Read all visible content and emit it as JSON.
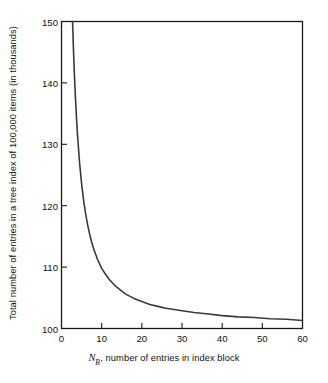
{
  "chart_data": {
    "type": "line",
    "title": "",
    "xlabel": "N_B, number of entries in index block",
    "xlabel_var": "N",
    "xlabel_sub": "B",
    "xlabel_rest": ", number of entries in index block",
    "ylabel": "Total number of entries in a tree index of 100,000 items (in thousands)",
    "xlim": [
      0,
      60
    ],
    "ylim": [
      100,
      150
    ],
    "xticks": [
      0,
      10,
      20,
      30,
      40,
      50,
      60
    ],
    "yticks": [
      100,
      110,
      120,
      130,
      140,
      150
    ],
    "xtick_labels": [
      "0",
      "10",
      "20",
      "30",
      "40",
      "50",
      "60"
    ],
    "ytick_labels": [
      "100",
      "110",
      "120",
      "130",
      "140",
      "150"
    ],
    "grid": false,
    "legend": "none",
    "line_color": "#3a3a3a",
    "axis_color": "#1a1a1a",
    "background": "#ffffff",
    "series": [
      {
        "name": "Total entries in tree index",
        "x": [
          2.75,
          3.0,
          3.25,
          3.5,
          3.75,
          4.0,
          4.5,
          5.0,
          5.5,
          6.0,
          6.5,
          7.0,
          7.5,
          8.0,
          9.0,
          10.0,
          11.0,
          12.0,
          13.0,
          14.0,
          15.0,
          16.0,
          18.0,
          20.0,
          22.0,
          24.0,
          26.0,
          28.0,
          30.0,
          33.0,
          36.0,
          40.0,
          44.0,
          48.0,
          52.0,
          56.0,
          60.0
        ],
        "y": [
          150.0,
          145.0,
          140.8,
          137.2,
          134.1,
          131.4,
          127.0,
          123.6,
          120.9,
          118.7,
          116.9,
          115.4,
          114.1,
          113.0,
          111.2,
          109.8,
          108.8,
          107.9,
          107.2,
          106.6,
          106.1,
          105.6,
          104.9,
          104.4,
          103.9,
          103.6,
          103.3,
          103.1,
          102.9,
          102.6,
          102.4,
          102.1,
          101.9,
          101.8,
          101.6,
          101.5,
          101.3
        ]
      }
    ]
  },
  "axes": {
    "ylabel_text": "Total number of entries in a tree index of 100,000 items (in thousands)",
    "xlabel_var": "N",
    "xlabel_sub": "B",
    "xlabel_rest": ", number of entries in index block"
  }
}
